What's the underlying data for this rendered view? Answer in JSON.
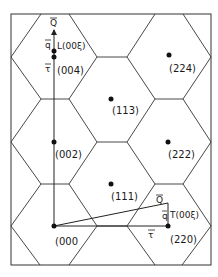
{
  "diagram": {
    "title": "",
    "spots": [
      {
        "label": "(000",
        "x": 54,
        "y": 226
      },
      {
        "label": "(002)",
        "x": 54,
        "y": 142
      },
      {
        "label": "(004)",
        "x": 54,
        "y": 57
      },
      {
        "label": "(111)",
        "x": 111,
        "y": 184
      },
      {
        "label": "(113)",
        "x": 111,
        "y": 99
      },
      {
        "label": "(220)",
        "x": 168,
        "y": 226
      },
      {
        "label": "(222)",
        "x": 168,
        "y": 142
      },
      {
        "label": "(224)",
        "x": 169,
        "y": 55
      }
    ],
    "longitudinal": {
      "point_label": "L(00ξ)",
      "Q_label": "Q",
      "q_label": "q",
      "tau_label": "τ"
    },
    "transverse": {
      "point_label": "T(00ξ)",
      "Q_label": "Q",
      "q_label": "q",
      "tau_label": "τ"
    },
    "line_color": "#333333"
  }
}
